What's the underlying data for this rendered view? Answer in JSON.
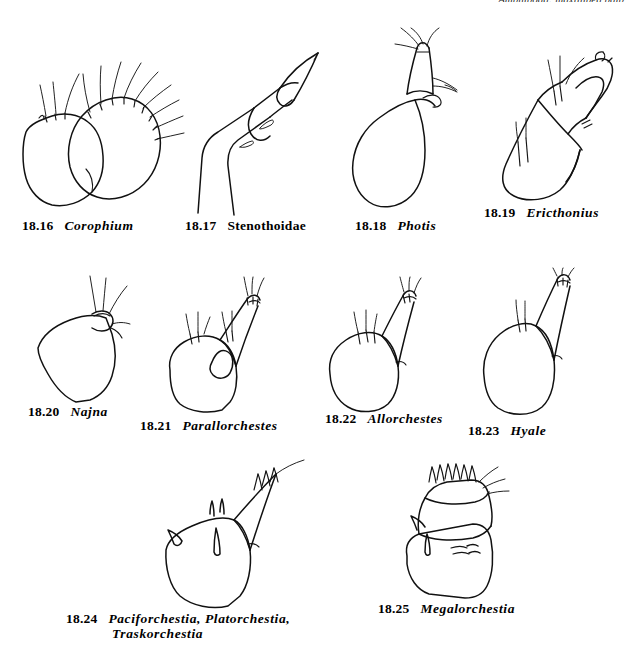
{
  "plate": {
    "running_head": "Amphipoda: maxilliped palp",
    "background_color": "#ffffff",
    "ink_color": "#111111",
    "width": 634,
    "height": 646
  },
  "figures": [
    {
      "id": "18.16",
      "number": "18.16",
      "taxon": "Corophium",
      "style": "italic",
      "description": "two overlapping rounded lobes, larger right lobe with long radiating setae"
    },
    {
      "id": "18.17",
      "number": "18.17",
      "taxon": "Stenothoidae",
      "style": "roman",
      "description": "elongate tapering segmented palp with pointed terminal article"
    },
    {
      "id": "18.18",
      "number": "18.18",
      "taxon": "Photis",
      "style": "italic",
      "description": "pear-shaped basal article with slender setose terminal article"
    },
    {
      "id": "18.19",
      "number": "18.19",
      "taxon": "Ericthonius",
      "style": "italic",
      "description": "elongate article with hooked terminal article and marginal setae"
    },
    {
      "id": "18.20",
      "number": "18.20",
      "taxon": "Najna",
      "style": "italic",
      "description": "broad triangular lobe with minute apical article bearing setae"
    },
    {
      "id": "18.21",
      "number": "18.21",
      "taxon": "Parallorchestes",
      "style": "italic",
      "description": "rounded basal lobe, tapering terminal article, inner triangular lobe, three setal tufts"
    },
    {
      "id": "18.22",
      "number": "18.22",
      "taxon": "Allorchestes",
      "style": "italic",
      "description": "rounded basal lobe with tapering terminal article and two setal tufts"
    },
    {
      "id": "18.23",
      "number": "18.23",
      "taxon": "Hyale",
      "style": "italic",
      "description": "elongate basal lobe with slender terminal article, setae at mid-margin and apex"
    },
    {
      "id": "18.24",
      "number": "18.24",
      "taxon_line1": "Paciforchestia, Platorchestia,",
      "taxon_line2": "Traskorchestia",
      "style": "italic",
      "description": "angular basal lobe with sharply pointed terminal article and spine-like setae"
    },
    {
      "id": "18.25",
      "number": "18.25",
      "taxon": "Megalorchestia",
      "style": "italic",
      "description": "boxy rectangular article with dense comb of short apical setae"
    }
  ]
}
